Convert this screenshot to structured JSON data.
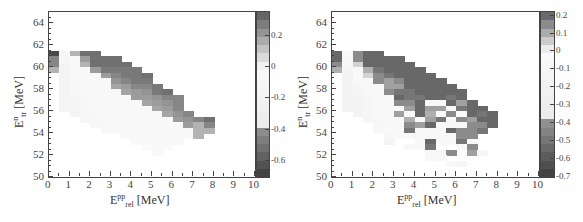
{
  "chart_data": [
    {
      "type": "heatmap",
      "title": "",
      "xlabel": "E_rel^pp [MeV]",
      "ylabel": "E_tr^n [MeV]",
      "xlim": [
        0,
        10
      ],
      "ylim": [
        50,
        65
      ],
      "xticks": [
        0,
        1,
        2,
        3,
        4,
        5,
        6,
        7,
        8,
        9,
        10
      ],
      "yticks": [
        50,
        52,
        54,
        56,
        58,
        60,
        62,
        64
      ],
      "bin_width_x": 0.5,
      "bin_width_y": 0.5,
      "colorbar": {
        "min": -0.7,
        "max": 0.35,
        "ticks": [
          0.2,
          0,
          -0.2,
          -0.4,
          -0.6
        ],
        "tick_labels": [
          "0.2",
          "0",
          "-0.2",
          "-0.4",
          "-0.6"
        ]
      },
      "grid_note": "rows from y=61.0 (top) down to y=51.5; columns from x=0.0 to x=7.5 in 0.5 MeV steps; null = empty",
      "y_rows": [
        61.0,
        60.5,
        60.0,
        59.5,
        59.0,
        58.5,
        58.0,
        57.5,
        57.0,
        56.5,
        56.0,
        55.5,
        55.0,
        54.5,
        54.0,
        53.5,
        53.0,
        52.5,
        52.0,
        51.5
      ],
      "values": [
        [
          -0.65,
          -0.1,
          0.15,
          0.3,
          0.3,
          null,
          null,
          null,
          null,
          null,
          null,
          null,
          null,
          null,
          null,
          null
        ],
        [
          0.25,
          -0.1,
          -0.05,
          0.2,
          0.3,
          0.3,
          0.3,
          null,
          null,
          null,
          null,
          null,
          null,
          null,
          null,
          null
        ],
        [
          0.25,
          -0.15,
          -0.05,
          0.15,
          0.3,
          0.3,
          0.3,
          0.3,
          null,
          null,
          null,
          null,
          null,
          null,
          null,
          null
        ],
        [
          0.15,
          -0.15,
          -0.05,
          -0.05,
          0.2,
          0.28,
          0.28,
          0.28,
          0.28,
          null,
          null,
          null,
          null,
          null,
          null,
          null
        ],
        [
          null,
          -0.15,
          -0.05,
          -0.05,
          -0.05,
          0.2,
          0.25,
          0.28,
          0.28,
          0.3,
          null,
          null,
          null,
          null,
          null,
          null
        ],
        [
          null,
          -0.15,
          -0.1,
          -0.05,
          -0.05,
          -0.05,
          0.22,
          0.25,
          0.28,
          0.28,
          null,
          null,
          null,
          null,
          null,
          null
        ],
        [
          null,
          -0.15,
          -0.1,
          -0.05,
          -0.05,
          -0.05,
          0.18,
          0.2,
          0.25,
          0.25,
          0.28,
          null,
          null,
          null,
          null,
          null
        ],
        [
          null,
          -0.15,
          -0.1,
          -0.05,
          -0.05,
          -0.05,
          -0.05,
          0.18,
          0.2,
          0.22,
          0.28,
          0.3,
          null,
          null,
          null,
          null
        ],
        [
          null,
          -0.15,
          -0.1,
          -0.08,
          -0.05,
          -0.05,
          -0.05,
          -0.05,
          0.2,
          0.2,
          0.22,
          0.25,
          0.25,
          null,
          null,
          null
        ],
        [
          null,
          -0.15,
          -0.12,
          -0.08,
          -0.05,
          -0.05,
          -0.05,
          -0.05,
          -0.05,
          0.18,
          0.2,
          0.22,
          0.25,
          null,
          null,
          null
        ],
        [
          null,
          -0.15,
          -0.12,
          -0.08,
          -0.05,
          -0.05,
          -0.05,
          -0.05,
          -0.05,
          -0.05,
          0.18,
          0.2,
          0.25,
          null,
          null,
          null
        ],
        [
          null,
          null,
          -0.15,
          -0.1,
          -0.05,
          -0.05,
          -0.05,
          -0.05,
          -0.05,
          -0.05,
          -0.05,
          0.18,
          0.22,
          0.25,
          null,
          null
        ],
        [
          null,
          null,
          null,
          -0.1,
          -0.08,
          -0.05,
          -0.05,
          -0.05,
          -0.05,
          -0.05,
          -0.05,
          -0.05,
          0.2,
          0.22,
          0.25,
          0.3
        ],
        [
          null,
          null,
          null,
          null,
          -0.08,
          -0.05,
          -0.05,
          -0.05,
          -0.05,
          -0.05,
          -0.05,
          -0.05,
          -0.05,
          0.2,
          0.15,
          0.25
        ],
        [
          null,
          null,
          null,
          null,
          null,
          -0.05,
          -0.05,
          -0.05,
          -0.05,
          -0.05,
          -0.05,
          -0.05,
          -0.05,
          -0.05,
          0.15,
          0.15
        ],
        [
          null,
          null,
          null,
          null,
          null,
          null,
          null,
          -0.05,
          -0.05,
          -0.05,
          -0.05,
          -0.05,
          -0.05,
          -0.05,
          0.15,
          null
        ],
        [
          null,
          null,
          null,
          null,
          null,
          null,
          null,
          null,
          -0.03,
          -0.03,
          -0.03,
          -0.03,
          -0.03,
          null,
          null,
          null
        ],
        [
          null,
          null,
          null,
          null,
          null,
          null,
          null,
          null,
          null,
          -0.03,
          -0.03,
          -0.03,
          null,
          null,
          null,
          null
        ],
        [
          null,
          null,
          null,
          null,
          null,
          null,
          null,
          null,
          null,
          null,
          -0.02,
          null,
          null,
          null,
          null,
          null
        ],
        [
          null,
          null,
          null,
          null,
          null,
          null,
          null,
          null,
          null,
          null,
          null,
          null,
          null,
          null,
          null,
          null
        ]
      ]
    },
    {
      "type": "heatmap",
      "title": "",
      "xlabel": "E_rel^pp [MeV]",
      "ylabel": "E_tr^n [MeV]",
      "xlim": [
        0,
        10
      ],
      "ylim": [
        50,
        65
      ],
      "xticks": [
        0,
        1,
        2,
        3,
        4,
        5,
        6,
        7,
        8,
        9,
        10
      ],
      "yticks": [
        50,
        52,
        54,
        56,
        58,
        60,
        62,
        64
      ],
      "bin_width_x": 0.5,
      "bin_width_y": 0.5,
      "colorbar": {
        "min": -0.7,
        "max": 0.22,
        "ticks": [
          0.2,
          0.1,
          0,
          -0.1,
          -0.2,
          -0.3,
          -0.4,
          -0.5,
          -0.6,
          -0.7
        ],
        "tick_labels": [
          "0.2",
          "0.1",
          "0",
          "-0.1",
          "-0.2",
          "-0.3",
          "-0.4",
          "-0.5",
          "-0.6",
          "-0.7"
        ]
      },
      "grid_note": "rows from y=61.0 (top) down to y=50.5; columns from x=0.0 to x=7.5 in 0.5 MeV steps; null = empty",
      "y_rows": [
        61.0,
        60.5,
        60.0,
        59.5,
        59.0,
        58.5,
        58.0,
        57.5,
        57.0,
        56.5,
        56.0,
        55.5,
        55.0,
        54.5,
        54.0,
        53.5,
        53.0,
        52.5,
        52.0,
        51.5,
        51.0,
        50.5
      ],
      "values": [
        [
          0.2,
          -0.05,
          0.15,
          0.2,
          0.2,
          null,
          null,
          null,
          null,
          null,
          null,
          null,
          null,
          null,
          null,
          null
        ],
        [
          0.2,
          -0.1,
          0.15,
          0.2,
          0.2,
          0.2,
          0.2,
          null,
          null,
          null,
          null,
          null,
          null,
          null,
          null,
          null
        ],
        [
          0.15,
          -0.1,
          0.05,
          0.2,
          0.2,
          0.2,
          0.2,
          0.2,
          null,
          null,
          null,
          null,
          null,
          null,
          null,
          null
        ],
        [
          0.1,
          -0.15,
          -0.05,
          0.1,
          0.18,
          0.2,
          0.2,
          0.2,
          0.2,
          null,
          null,
          null,
          null,
          null,
          null,
          null
        ],
        [
          null,
          -0.15,
          -0.05,
          0.05,
          0.15,
          0.18,
          0.2,
          0.2,
          0.2,
          0.2,
          null,
          null,
          null,
          null,
          null,
          null
        ],
        [
          null,
          -0.15,
          -0.05,
          -0.05,
          0.15,
          0.12,
          0.15,
          0.2,
          0.2,
          0.2,
          0.2,
          null,
          null,
          null,
          null,
          null
        ],
        [
          null,
          -0.15,
          -0.1,
          -0.05,
          -0.05,
          0.12,
          0.12,
          0.2,
          0.2,
          0.2,
          0.2,
          0.2,
          null,
          null,
          null,
          null
        ],
        [
          null,
          -0.15,
          -0.1,
          -0.05,
          -0.05,
          0.15,
          0.18,
          0.18,
          0.2,
          0.2,
          0.2,
          0.2,
          0.2,
          null,
          null,
          null
        ],
        [
          null,
          -0.15,
          -0.15,
          -0.1,
          -0.05,
          -0.05,
          0.2,
          0.18,
          0.18,
          0.2,
          0.2,
          0.18,
          0.2,
          null,
          null,
          null
        ],
        [
          null,
          -0.15,
          -0.15,
          -0.1,
          -0.05,
          -0.05,
          0.15,
          0.15,
          0.2,
          -0.05,
          -0.05,
          0.2,
          0.12,
          0.2,
          null,
          null
        ],
        [
          null,
          -0.15,
          -0.15,
          -0.1,
          -0.05,
          -0.05,
          -0.05,
          0.12,
          0.2,
          0.12,
          0.12,
          -0.05,
          0.18,
          0.2,
          0.2,
          null
        ],
        [
          null,
          null,
          -0.15,
          -0.1,
          -0.05,
          -0.05,
          0.12,
          -0.05,
          0.2,
          0.1,
          -0.05,
          0.15,
          -0.05,
          0.2,
          0.18,
          0.2
        ],
        [
          null,
          null,
          null,
          -0.1,
          -0.08,
          -0.05,
          -0.05,
          0.1,
          -0.05,
          0.12,
          0.18,
          -0.05,
          0.15,
          0.12,
          0.2,
          0.2
        ],
        [
          null,
          null,
          null,
          null,
          -0.08,
          -0.05,
          -0.05,
          0.15,
          0.12,
          0.2,
          -0.05,
          -0.05,
          -0.05,
          0.15,
          0.15,
          0.2
        ],
        [
          null,
          null,
          null,
          null,
          -0.05,
          -0.05,
          -0.05,
          0.18,
          -0.05,
          -0.05,
          -0.05,
          0.2,
          0.15,
          0.15,
          0.18,
          null
        ],
        [
          null,
          null,
          null,
          null,
          null,
          -0.1,
          -0.05,
          -0.05,
          -0.05,
          -0.05,
          -0.05,
          -0.05,
          0.15,
          0.15,
          null,
          null
        ],
        [
          null,
          null,
          null,
          null,
          null,
          -0.15,
          null,
          null,
          -0.05,
          0.2,
          -0.05,
          -0.05,
          0.18,
          -0.05,
          null,
          null
        ],
        [
          null,
          null,
          null,
          null,
          null,
          null,
          null,
          -0.05,
          -0.05,
          0.18,
          null,
          null,
          -0.05,
          0.15,
          null,
          null
        ],
        [
          null,
          null,
          null,
          null,
          null,
          null,
          null,
          null,
          null,
          -0.05,
          -0.1,
          0.15,
          null,
          0.12,
          -0.1,
          null
        ],
        [
          null,
          null,
          null,
          null,
          null,
          null,
          null,
          null,
          null,
          -0.05,
          -0.05,
          null,
          null,
          null,
          null,
          null
        ],
        [
          null,
          null,
          null,
          null,
          null,
          null,
          null,
          null,
          null,
          null,
          null,
          -0.05,
          -0.1,
          null,
          null,
          null
        ],
        [
          null,
          null,
          null,
          null,
          null,
          null,
          null,
          null,
          null,
          null,
          null,
          null,
          null,
          null,
          null,
          null
        ]
      ]
    }
  ],
  "labels": {
    "x_main": "E",
    "x_sup": "pp",
    "x_sub": "rel",
    "x_unit": " [MeV]",
    "y_main": "E",
    "y_sup": "n",
    "y_sub": "tr",
    "y_unit": " [MeV]"
  }
}
